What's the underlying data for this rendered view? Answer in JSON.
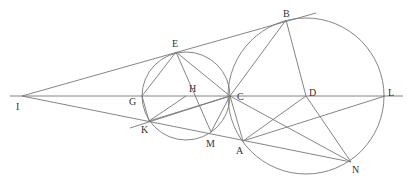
{
  "diagram": {
    "title": "",
    "points": {
      "I": {
        "label": "I",
        "x": 22,
        "y": 96,
        "lx": 16,
        "ly": 110
      },
      "E": {
        "label": "E",
        "x": 176,
        "y": 52,
        "lx": 172,
        "ly": 47
      },
      "B": {
        "label": "B",
        "x": 286,
        "y": 20,
        "lx": 283,
        "ly": 17
      },
      "G": {
        "label": "G",
        "x": 142,
        "y": 96,
        "lx": 129,
        "ly": 105
      },
      "H": {
        "label": "H",
        "x": 186,
        "y": 96,
        "lx": 189,
        "ly": 92
      },
      "C": {
        "label": "C",
        "x": 230,
        "y": 96,
        "lx": 237,
        "ly": 100
      },
      "D": {
        "label": "D",
        "x": 306,
        "y": 96,
        "lx": 309,
        "ly": 96
      },
      "L": {
        "label": "L",
        "x": 385,
        "y": 96,
        "lx": 388,
        "ly": 96
      },
      "K": {
        "label": "K",
        "x": 149,
        "y": 121,
        "lx": 141,
        "ly": 133
      },
      "M": {
        "label": "M",
        "x": 211,
        "y": 132,
        "lx": 206,
        "ly": 147
      },
      "A": {
        "label": "A",
        "x": 243,
        "y": 141,
        "lx": 236,
        "ly": 154
      },
      "N": {
        "label": "N",
        "x": 351,
        "y": 162,
        "lx": 352,
        "ly": 173
      }
    },
    "circles": [
      {
        "name": "small-circle",
        "cx": 186,
        "cy": 96,
        "r": 44
      },
      {
        "name": "large-circle",
        "cx": 306,
        "cy": 96,
        "r": 78
      }
    ],
    "stroke_color": "#777777"
  }
}
